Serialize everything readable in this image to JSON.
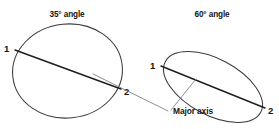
{
  "figure": {
    "title_left": "35° angle",
    "title_right": "60° angle",
    "axis_caption": "Major axis",
    "background_color": "#ffffff",
    "outline_color": "#3a3a3a",
    "axis_color": "#1f1f1f",
    "leader_color": "#7a7a7a"
  },
  "left_ellipse": {
    "title": "35° angle",
    "angle_degrees": 35,
    "point_start_label": "1",
    "point_end_label": "2"
  },
  "right_ellipse": {
    "title": "60° angle",
    "angle_degrees": 60,
    "point_start_label": "1",
    "point_end_label": "2"
  }
}
